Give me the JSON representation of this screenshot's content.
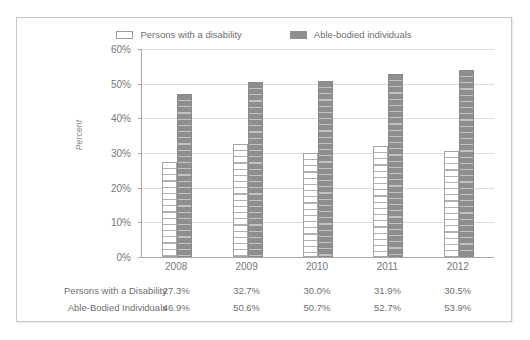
{
  "chart_data": {
    "type": "bar",
    "title": "",
    "subtitle": "",
    "xlabel": "",
    "ylabel": "Percent",
    "categories": [
      "2008",
      "2009",
      "2010",
      "2011",
      "2012"
    ],
    "series": [
      {
        "name": "Persons with a disability",
        "table_label": "Persons with a Disability",
        "values": [
          27.3,
          32.7,
          30.0,
          31.9,
          30.5
        ],
        "value_labels": [
          "27.3%",
          "32.7%",
          "30.0%",
          "31.9%",
          "30.5%"
        ],
        "swatch": "hollow",
        "color": "#ffffff",
        "border_color": "#a5a5a5"
      },
      {
        "name": "Able-bodied individuals",
        "table_label": "Able-Bodied Individuals",
        "values": [
          46.9,
          50.6,
          50.7,
          52.7,
          53.9
        ],
        "value_labels": [
          "46.9%",
          "50.6%",
          "50.7%",
          "52.7%",
          "53.9%"
        ],
        "swatch": "solid",
        "color": "#8e8e8e",
        "border_color": "#8a8a8a"
      }
    ],
    "ylim": [
      0,
      60
    ],
    "ytick_values": [
      0,
      10,
      20,
      30,
      40,
      50,
      60
    ],
    "ytick_labels": [
      "0%",
      "10%",
      "20%",
      "30%",
      "40%",
      "50%",
      "60%"
    ],
    "grid": true,
    "legend_position": "top-center",
    "annotations": []
  },
  "legend": {
    "items": [
      {
        "label": "Persons with a disability",
        "swatch": "hollow-rect-swatch"
      },
      {
        "label": "Able-bodied individuals",
        "swatch": "solid-rect-swatch"
      }
    ]
  },
  "axis": {
    "y_title": "Percent"
  },
  "table": {
    "rows": [
      {
        "label": "Persons with a Disability",
        "cells": [
          "27.3%",
          "32.7%",
          "30.0%",
          "31.9%",
          "30.5%"
        ]
      },
      {
        "label": "Able-Bodied Individuals",
        "cells": [
          "46.9%",
          "50.6%",
          "50.7%",
          "52.7%",
          "53.9%"
        ]
      }
    ]
  },
  "colors": {
    "frame_border": "#c9c9c9",
    "axis_line": "#a8a8a8",
    "gridline": "#dcdcdc",
    "text": "#6f6f6f",
    "series_disability": "#ffffff",
    "series_ablebodied": "#8e8e8e"
  }
}
